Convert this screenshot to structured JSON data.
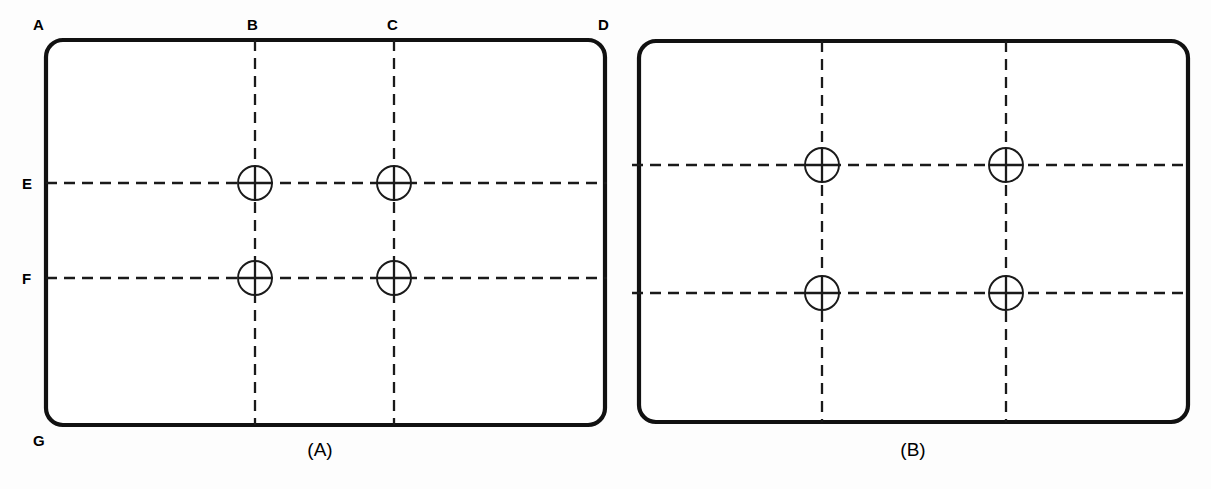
{
  "figure": {
    "background_color": "#fdfdfd",
    "line_color": "#111111",
    "width": 1211,
    "height": 489
  },
  "panels": [
    {
      "id": "A",
      "caption": "(A)",
      "description": "Plate with datum edge labels and center lines",
      "outline": {
        "x": 46,
        "y": 40,
        "width": 559,
        "height": 385,
        "corner_radius": 17
      },
      "corner_labels": [
        {
          "label": "A",
          "x": 33,
          "y": 30,
          "anchor": "top-left-corner"
        },
        {
          "label": "B",
          "x": 247,
          "y": 30,
          "anchor": "top-edge-first-centerline"
        },
        {
          "label": "C",
          "x": 387,
          "y": 30,
          "anchor": "top-edge-second-centerline"
        },
        {
          "label": "D",
          "x": 598,
          "y": 30,
          "anchor": "top-right-corner"
        },
        {
          "label": "E",
          "x": 22,
          "y": 189,
          "anchor": "left-edge-first-centerline"
        },
        {
          "label": "F",
          "x": 22,
          "y": 284,
          "anchor": "left-edge-second-centerline"
        },
        {
          "label": "G",
          "x": 33,
          "y": 446,
          "anchor": "bottom-left-corner"
        }
      ],
      "vertical_center_lines": [
        {
          "name": "B",
          "x": 255,
          "y_start": 40,
          "y_end": 425
        },
        {
          "name": "C",
          "x": 394,
          "y_start": 40,
          "y_end": 425
        }
      ],
      "horizontal_center_lines": [
        {
          "name": "E",
          "y": 183,
          "x_start": 46,
          "x_end": 607
        },
        {
          "name": "F",
          "y": 278,
          "x_start": 46,
          "x_end": 607
        }
      ],
      "holes": [
        {
          "cx": 255,
          "cy": 183,
          "r": 17,
          "row": "E",
          "column": "B"
        },
        {
          "cx": 394,
          "cy": 183,
          "r": 17,
          "row": "E",
          "column": "C"
        },
        {
          "cx": 255,
          "cy": 278,
          "r": 17,
          "row": "F",
          "column": "B"
        },
        {
          "cx": 394,
          "cy": 278,
          "r": 17,
          "row": "F",
          "column": "C"
        }
      ],
      "caption_position": {
        "x": 320,
        "y": 456
      }
    },
    {
      "id": "B",
      "caption": "(B)",
      "description": "Plate with center lines only, no datum edge labels",
      "outline": {
        "x": 639,
        "y": 41,
        "width": 549,
        "height": 381,
        "corner_radius": 17
      },
      "corner_labels": [],
      "vertical_center_lines": [
        {
          "name": "left",
          "x": 822,
          "y_start": 41,
          "y_end": 422
        },
        {
          "name": "right",
          "x": 1006,
          "y_start": 41,
          "y_end": 422
        }
      ],
      "horizontal_center_lines": [
        {
          "name": "upper",
          "y": 165,
          "x_start": 632,
          "x_end": 1190
        },
        {
          "name": "lower",
          "y": 293,
          "x_start": 632,
          "x_end": 1190
        }
      ],
      "holes": [
        {
          "cx": 822,
          "cy": 165,
          "r": 17,
          "row": "upper",
          "column": "left"
        },
        {
          "cx": 1006,
          "cy": 165,
          "r": 17,
          "row": "upper",
          "column": "right"
        },
        {
          "cx": 822,
          "cy": 293,
          "r": 17,
          "row": "lower",
          "column": "left"
        },
        {
          "cx": 1006,
          "cy": 293,
          "r": 17,
          "row": "lower",
          "column": "right"
        }
      ],
      "caption_position": {
        "x": 913,
        "y": 456
      }
    }
  ]
}
